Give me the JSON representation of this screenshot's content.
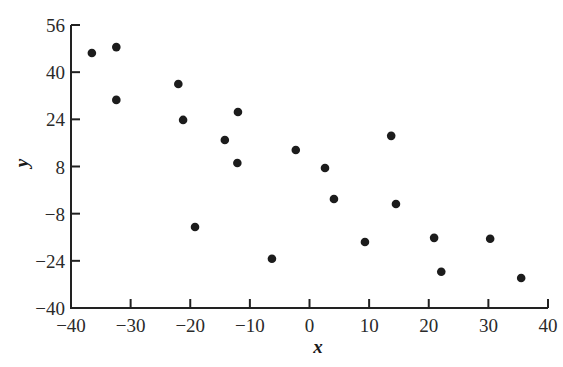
{
  "chart_data": {
    "type": "scatter",
    "title": "",
    "xlabel": "x",
    "ylabel": "y",
    "xlim": [
      -40,
      40
    ],
    "ylim": [
      -40,
      56
    ],
    "xticks": [
      -40,
      -30,
      -20,
      -10,
      0,
      10,
      20,
      30,
      40
    ],
    "yticks": [
      -40,
      -24,
      -8,
      8,
      24,
      40,
      56
    ],
    "grid": false,
    "legend": null,
    "marker_color": "#1c1c1c",
    "points": [
      {
        "x": -36.5,
        "y": 46.5
      },
      {
        "x": -32.4,
        "y": 48.5
      },
      {
        "x": -32.4,
        "y": 30.6
      },
      {
        "x": -22.0,
        "y": 36.0
      },
      {
        "x": -21.2,
        "y": 23.8
      },
      {
        "x": -19.2,
        "y": -12.5
      },
      {
        "x": -14.2,
        "y": 17.0
      },
      {
        "x": -12.0,
        "y": 26.5
      },
      {
        "x": -12.1,
        "y": 9.2
      },
      {
        "x": -6.3,
        "y": -23.3
      },
      {
        "x": -2.3,
        "y": 13.6
      },
      {
        "x": 2.6,
        "y": 7.5
      },
      {
        "x": 4.1,
        "y": -3.0
      },
      {
        "x": 9.3,
        "y": -17.6
      },
      {
        "x": 13.7,
        "y": 18.4
      },
      {
        "x": 14.5,
        "y": -4.7
      },
      {
        "x": 20.9,
        "y": -16.2
      },
      {
        "x": 22.1,
        "y": -27.7
      },
      {
        "x": 30.3,
        "y": -16.5
      },
      {
        "x": 35.5,
        "y": -29.8
      }
    ]
  }
}
